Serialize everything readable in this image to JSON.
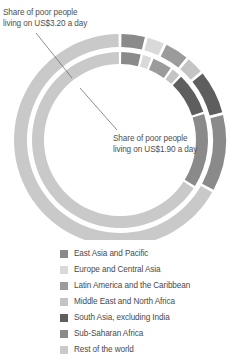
{
  "annotations": {
    "outer_ring": {
      "text": "Share of poor people\nliving on US$3.20 a day"
    },
    "inner_ring": {
      "text": "Share of poor people\nliving on US$1.90 a day"
    }
  },
  "legend": {
    "items": [
      {
        "label": "East Asia and Pacific",
        "color": "#8a8a8a"
      },
      {
        "label": "Europe and Central Asia",
        "color": "#d9d9d9"
      },
      {
        "label": "Latin America and the Caribbean",
        "color": "#9b9b9b"
      },
      {
        "label": "Middle East and North Africa",
        "color": "#c4c4c4"
      },
      {
        "label": "South Asia, excluding India",
        "color": "#5e5e5e"
      },
      {
        "label": "Sub-Saharan Africa",
        "color": "#8a8a8a"
      },
      {
        "label": "Rest of the world",
        "color": "#c9c9c9"
      }
    ]
  },
  "chart_data": {
    "type": "pie",
    "title": "",
    "subtitle": "",
    "xlabel": "",
    "ylabel": "",
    "legend_position": "bottom",
    "grid": false,
    "note": "Nested donut: outer ring = share of poor people living on US$3.20 a day; inner ring = share of poor people living on US$1.90 a day. Values are percent shares, start angle 12 o'clock, drawn clockwise.",
    "categories": [
      "East Asia and Pacific",
      "Europe and Central Asia",
      "Latin America and the Caribbean",
      "Middle East and North Africa",
      "South Asia, excluding India",
      "Sub-Saharan Africa",
      "Rest of the world"
    ],
    "colors": [
      "#8a8a8a",
      "#d9d9d9",
      "#9b9b9b",
      "#c4c4c4",
      "#5e5e5e",
      "#8a8a8a",
      "#c9c9c9"
    ],
    "series": [
      {
        "name": "Share of poor people living on US$3.20 a day",
        "ring": "outer",
        "values": [
          4,
          3,
          4,
          3,
          7,
          12,
          67
        ]
      },
      {
        "name": "Share of poor people living on US$1.90 a day",
        "ring": "inner",
        "values": [
          4,
          2,
          4,
          2,
          8,
          14,
          66
        ]
      }
    ]
  },
  "geometry": {
    "center_x": 120,
    "center_y": 140,
    "outer_ring": {
      "r_outer": 106,
      "r_inner": 93
    },
    "inner_ring": {
      "r_outer": 88,
      "r_inner": 76
    },
    "start_angle_deg": -90,
    "gap_deg": 1.6
  }
}
